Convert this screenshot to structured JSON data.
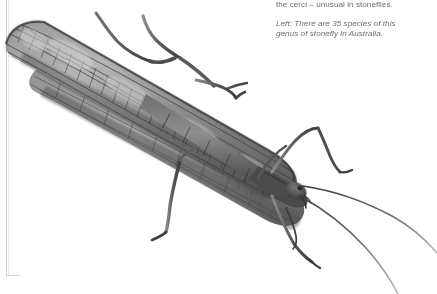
{
  "page": {
    "background_color": "#ffffff",
    "rule_color": "#d2d2d2"
  },
  "caption": {
    "text_color": "#6c6c6c",
    "paragraph_1": {
      "lines": [
        "the cerci – unusual in stoneflies."
      ]
    },
    "paragraph_2": {
      "style": "italic",
      "lines": [
        "Left: There are 35 species of this",
        "genus of stonefly in Australia."
      ]
    }
  },
  "photograph": {
    "subject": "stonefly",
    "rendering": "grayscale-photograph",
    "tones": {
      "darkest": "#2e2e2e",
      "dark": "#4a4a4a",
      "mid": "#777777",
      "light": "#a8a8a8",
      "lightest": "#d8d8d8",
      "paper": "#ffffff"
    },
    "parts": [
      "forewing",
      "hindwing",
      "abdomen",
      "thorax",
      "head",
      "antenna-left",
      "antenna-right",
      "foreleg",
      "midleg",
      "hindleg"
    ]
  }
}
